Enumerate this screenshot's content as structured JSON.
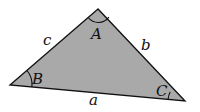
{
  "diagram": {
    "type": "triangle",
    "fill_color": "#a9a9a9",
    "stroke_color": "#111111",
    "vertices": {
      "A": {
        "x": 98,
        "y": 9
      },
      "B": {
        "x": 10,
        "y": 85
      },
      "C": {
        "x": 185,
        "y": 101
      }
    },
    "angle_labels": {
      "A": "A",
      "B": "B",
      "C": "C"
    },
    "side_labels": {
      "a": "a",
      "b": "b",
      "c": "c"
    }
  }
}
